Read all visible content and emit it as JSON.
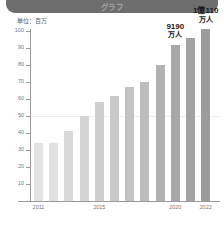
{
  "header": {
    "title": "グラフ"
  },
  "unit_label": "単位：百万",
  "annotations": [
    {
      "value": "9190",
      "unit": "万人"
    },
    {
      "value": "1億110",
      "unit": "万人"
    }
  ],
  "chart_data": {
    "type": "bar",
    "title": "",
    "subtitle": "",
    "xlabel": "",
    "ylabel": "単位：百万",
    "ylim": [
      0,
      105
    ],
    "yticks": [
      10,
      20,
      30,
      40,
      50,
      60,
      70,
      80,
      90,
      100
    ],
    "grid": false,
    "legend": "none",
    "categories": [
      "2011",
      "2012",
      "2013",
      "2014",
      "2015",
      "2016",
      "2017",
      "2018",
      "2019",
      "2020",
      "2021",
      "2022"
    ],
    "tick_labels": [
      "2011",
      "2015",
      "2020",
      "2022"
    ],
    "tick_label_indices": [
      0,
      4,
      9,
      11
    ],
    "values": [
      34,
      34,
      41,
      50,
      58,
      62,
      67,
      70,
      80,
      92,
      96,
      101
    ],
    "bar_colors": [
      "#e3e3e3",
      "#e0e0e0",
      "#dadada",
      "#d4d4d4",
      "#cfcfcf",
      "#c9c9c9",
      "#c3c3c3",
      "#bdbdbd",
      "#b2b2b2",
      "#a8a8a8",
      "#a2a2a2",
      "#9c9c9c"
    ],
    "annotations": [
      {
        "index": 9,
        "label": "9190万人"
      },
      {
        "index": 11,
        "label": "1億110万人"
      }
    ]
  }
}
